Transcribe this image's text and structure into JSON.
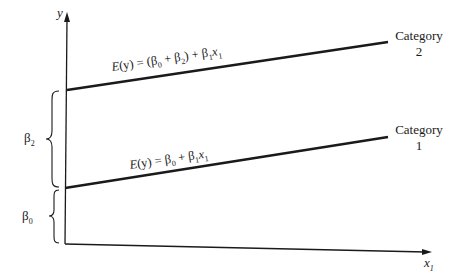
{
  "diagram": {
    "axes": {
      "y_label": "y",
      "x_label": "x",
      "x_subscript": "1"
    },
    "lines": [
      {
        "name": "Category 2",
        "category_label": "Category",
        "category_number": "2",
        "equation": "E(y) = (β0 + β2) + β1x1",
        "eq_parts": {
          "prefix": "E",
          "open": "(y) = (β",
          "s0": "0",
          "mid": " + β",
          "s2": "2",
          "mid2": ") + β",
          "s1": "1",
          "x": "x",
          "sx": "1"
        }
      },
      {
        "name": "Category 1",
        "category_label": "Category",
        "category_number": "1",
        "equation": "E(y) = β0 + β1x1",
        "eq_parts": {
          "prefix": "E",
          "open": "(y) = β",
          "s0": "0",
          "mid": " + β",
          "s1": "1",
          "x": "x",
          "sx": "1"
        }
      }
    ],
    "braces": [
      {
        "label": "β",
        "sub": "2",
        "meaning": "difference between category intercepts"
      },
      {
        "label": "β",
        "sub": "0",
        "meaning": "category 1 intercept"
      }
    ],
    "colors": {
      "ink": "#1a1a1a",
      "background": "#ffffff"
    }
  }
}
